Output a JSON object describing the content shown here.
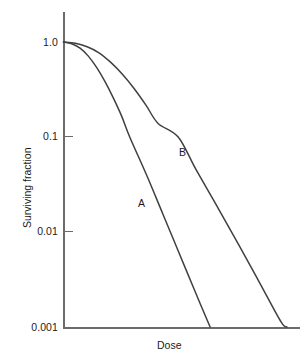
{
  "chart_data": {
    "type": "line",
    "title": "",
    "subtitle": "",
    "xlabel": "Dose",
    "ylabel": "Surviving fraction",
    "yscale": "log",
    "xscale": "linear",
    "ylim": [
      0.001,
      1.0
    ],
    "xlim": [
      0,
      10
    ],
    "ytick_labels": [
      "1.0",
      "0.1",
      "0.01",
      "0.001"
    ],
    "ytick_values": [
      1.0,
      0.1,
      0.01,
      0.001
    ],
    "xtick_labels": [],
    "grid": false,
    "legend": "inline-curve-labels",
    "annotations": [
      {
        "text": "A",
        "x": 2.6,
        "y": 0.028
      },
      {
        "text": "B",
        "x": 4.05,
        "y": 0.072
      }
    ],
    "series": [
      {
        "name": "A",
        "label": "A",
        "color": "#404040",
        "description": "Steeper survival curve with small shoulder; reaches 0.001 at lower dose.",
        "points": [
          {
            "x": 0.0,
            "y": 1.0
          },
          {
            "x": 0.35,
            "y": 0.96
          },
          {
            "x": 0.7,
            "y": 0.86
          },
          {
            "x": 1.05,
            "y": 0.71
          },
          {
            "x": 1.4,
            "y": 0.54
          },
          {
            "x": 1.75,
            "y": 0.385
          },
          {
            "x": 2.1,
            "y": 0.26
          },
          {
            "x": 2.45,
            "y": 0.168
          },
          {
            "x": 2.8,
            "y": 0.1
          },
          {
            "x": 3.5,
            "y": 0.0405
          },
          {
            "x": 4.2,
            "y": 0.0155
          },
          {
            "x": 4.9,
            "y": 0.0059
          },
          {
            "x": 5.6,
            "y": 0.00225
          },
          {
            "x": 6.2,
            "y": 0.001
          }
        ]
      },
      {
        "name": "B",
        "label": "B",
        "color": "#404040",
        "description": "Shallower survival curve with broader shoulder; reaches 0.001 at higher dose.",
        "points": [
          {
            "x": 0.0,
            "y": 1.0
          },
          {
            "x": 0.5,
            "y": 0.97
          },
          {
            "x": 1.0,
            "y": 0.89
          },
          {
            "x": 1.5,
            "y": 0.77
          },
          {
            "x": 2.0,
            "y": 0.61
          },
          {
            "x": 2.5,
            "y": 0.455
          },
          {
            "x": 3.0,
            "y": 0.32
          },
          {
            "x": 3.5,
            "y": 0.214
          },
          {
            "x": 4.0,
            "y": 0.139
          },
          {
            "x": 4.85,
            "y": 0.1
          },
          {
            "x": 5.6,
            "y": 0.0455
          },
          {
            "x": 6.5,
            "y": 0.0185
          },
          {
            "x": 7.4,
            "y": 0.0074
          },
          {
            "x": 8.3,
            "y": 0.0029
          },
          {
            "x": 9.2,
            "y": 0.00113
          },
          {
            "x": 9.45,
            "y": 0.001
          }
        ]
      }
    ]
  },
  "axis": {
    "ylabel": "Surviving fraction",
    "xlabel": "Dose",
    "ticks": [
      {
        "label": "1.0"
      },
      {
        "label": "0.1"
      },
      {
        "label": "0.01"
      },
      {
        "label": "0.001"
      }
    ]
  },
  "labels": {
    "curve_a": "A",
    "curve_b": "B"
  },
  "colors": {
    "background": "#ffffff",
    "axis": "#6b6b6b",
    "curve": "#404040",
    "text": "#1c1c1c"
  }
}
